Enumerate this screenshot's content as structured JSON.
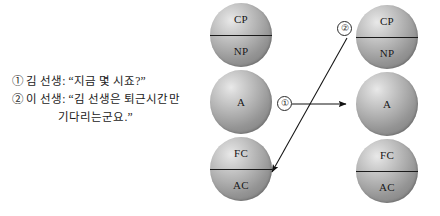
{
  "dialogue": {
    "lines": [
      "① 김 선생: “지금 몇 시죠?”",
      "② 이 선생: “김 선생은 퇴근시간만",
      "기다리는군요.”"
    ]
  },
  "stacks": {
    "left": {
      "label": "person-a-ego-states",
      "spheres": [
        {
          "name": "parent",
          "top": "CP",
          "bottom": "NP",
          "split": true
        },
        {
          "name": "adult",
          "whole": "A",
          "split": false
        },
        {
          "name": "child",
          "top": "FC",
          "bottom": "AC",
          "split": true
        }
      ]
    },
    "right": {
      "label": "person-b-ego-states",
      "spheres": [
        {
          "name": "parent",
          "top": "CP",
          "bottom": "NP",
          "split": true
        },
        {
          "name": "adult",
          "whole": "A",
          "split": false
        },
        {
          "name": "child",
          "top": "FC",
          "bottom": "AC",
          "split": true
        }
      ]
    }
  },
  "connectors": {
    "arrow_one": {
      "label": "①",
      "from": "left-adult",
      "to": "right-adult",
      "direction": "right"
    },
    "arrow_two": {
      "label": "②",
      "from": "right-parent",
      "to": "left-child",
      "direction": "down-left"
    }
  },
  "colors": {
    "stroke": "#1a1a1a",
    "sphere_light": "#e9e9e9",
    "sphere_dark": "#888888",
    "background": "#ffffff"
  }
}
